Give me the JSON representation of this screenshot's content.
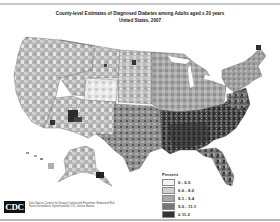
{
  "header": {
    "title": "County-level Estimates of Diagnosed Diabetes among Adults aged ≥ 20 years",
    "subtitle": "United States, 2007"
  },
  "legend": {
    "title": "Percent",
    "items": [
      {
        "label": "0 - 6.5",
        "color": "#f4f4f4"
      },
      {
        "label": "6.6 - 8.0",
        "color": "#d0d0d0"
      },
      {
        "label": "8.1 - 9.4",
        "color": "#a8a8a8"
      },
      {
        "label": "9.5 - 11.1",
        "color": "#777777"
      },
      {
        "label": "≥ 11.2",
        "color": "#333333"
      }
    ]
  },
  "footer": {
    "logo_text": "CDC",
    "source_text": "Data Source: Centers for Disease Control and Prevention: Behavioral Risk Factor Surveillance System and the U.S. Census Bureau."
  },
  "map": {
    "region": "United States",
    "year": "2007",
    "insets": [
      "Alaska",
      "Hawaii"
    ]
  }
}
